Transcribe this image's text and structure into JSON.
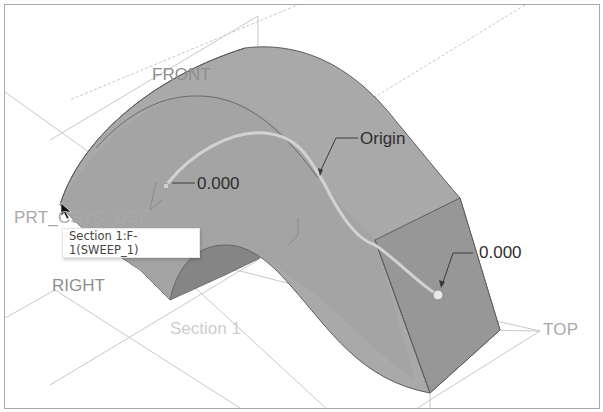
{
  "viewport": {
    "background": "#ffffff",
    "border_color": "#a8a8a8"
  },
  "model": {
    "surface_color": "#a9a9a9",
    "surface_light": "#b3b3b3",
    "surface_dark": "#8c8c8c",
    "end_face_color": "#979797",
    "edge_color": "#5e5e5e",
    "trajectory_color": "#d2d2d2"
  },
  "datum_planes": {
    "front": "FRONT",
    "right": "RIGHT",
    "top": "TOP",
    "csys": "PRT_CSYS_DEF",
    "line_color": "#c8c8c8"
  },
  "sketch": {
    "section_label": "Section 1"
  },
  "annotations": {
    "origin_label": "Origin",
    "start_dimension": "0.000",
    "end_dimension": "0.000"
  },
  "tooltip": {
    "text": "Section 1:F-1(SWEEP_1)"
  }
}
